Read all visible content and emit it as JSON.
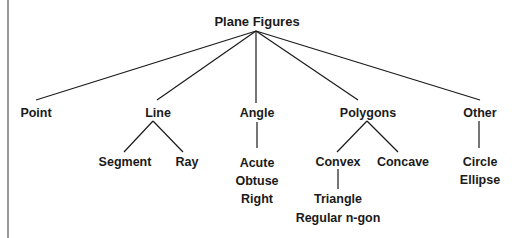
{
  "diagram": {
    "title": "Plane Figures",
    "type": "tree",
    "line_color": "#1a1a1a",
    "border_color": "#333333",
    "root": {
      "label": "Plane Figures",
      "children": [
        {
          "label": "Point",
          "children": []
        },
        {
          "label": "Line",
          "children": [
            {
              "label": "Segment"
            },
            {
              "label": "Ray"
            }
          ]
        },
        {
          "label": "Angle",
          "items": [
            "Acute",
            "Obtuse",
            "Right"
          ]
        },
        {
          "label": "Polygons",
          "children": [
            {
              "label": "Convex",
              "items": [
                "Triangle",
                "Regular n-gon"
              ]
            },
            {
              "label": "Concave"
            }
          ]
        },
        {
          "label": "Other",
          "items": [
            "Circle",
            "Ellipse"
          ]
        }
      ]
    }
  },
  "labels": {
    "root": "Plane Figures",
    "point": "Point",
    "line": "Line",
    "angle": "Angle",
    "polygons": "Polygons",
    "other": "Other",
    "segment": "Segment",
    "ray": "Ray",
    "acute": "Acute",
    "obtuse": "Obtuse",
    "right": "Right",
    "convex": "Convex",
    "concave": "Concave",
    "triangle": "Triangle",
    "regular_ngon": "Regular n-gon",
    "circle": "Circle",
    "ellipse": "Ellipse"
  }
}
